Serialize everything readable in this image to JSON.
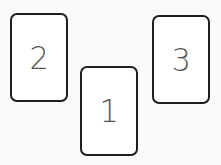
{
  "cards": [
    {
      "label": "2"
    },
    {
      "label": "1"
    },
    {
      "label": "3"
    }
  ]
}
